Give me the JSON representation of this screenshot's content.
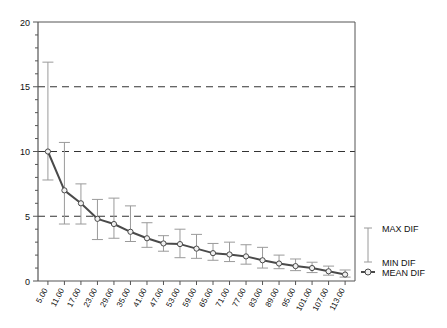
{
  "chart_data": {
    "type": "line",
    "title": "",
    "xlabel": "",
    "ylabel": "",
    "ylim": [
      0,
      20
    ],
    "yticks": [
      0,
      5,
      10,
      15,
      20
    ],
    "ytick_labels": [
      "0",
      "5",
      "10",
      "15",
      "20"
    ],
    "y_minor_tick_step": 1,
    "grid": "horizontal dashed at 5, 10, 15",
    "legend_position": "right",
    "categories": [
      "5.00",
      "11.00",
      "17.00",
      "23.00",
      "29.00",
      "35.00",
      "41.00",
      "47.00",
      "53.00",
      "59.00",
      "65.00",
      "71.00",
      "77.00",
      "83.00",
      "89.00",
      "95.00",
      "101.00",
      "107.00",
      "113.00"
    ],
    "series": [
      {
        "name": "MEAN DIF",
        "values": [
          10.0,
          7.0,
          6.0,
          4.8,
          4.4,
          3.8,
          3.3,
          2.9,
          2.85,
          2.5,
          2.15,
          2.05,
          1.9,
          1.6,
          1.35,
          1.15,
          1.0,
          0.75,
          0.5
        ]
      },
      {
        "name": "MAX DIF",
        "values": [
          16.9,
          10.7,
          7.5,
          6.3,
          6.4,
          5.8,
          4.5,
          3.5,
          4.0,
          3.6,
          2.9,
          3.0,
          2.8,
          2.6,
          2.0,
          1.7,
          1.45,
          1.15,
          0.85
        ]
      },
      {
        "name": "MIN DIF",
        "values": [
          7.8,
          4.4,
          4.4,
          3.2,
          3.3,
          3.05,
          2.6,
          2.3,
          1.8,
          1.75,
          1.6,
          1.5,
          1.3,
          1.0,
          0.95,
          0.8,
          0.65,
          0.45,
          0.3
        ]
      }
    ]
  },
  "legend": {
    "items": [
      {
        "label": "MAX DIF",
        "marker": "errorbar-top-cap"
      },
      {
        "label": "MIN DIF",
        "marker": "errorbar-bottom-cap"
      },
      {
        "label": "MEAN DIF",
        "marker": "circle-line"
      }
    ]
  },
  "colors": {
    "axis": "#555555",
    "grid": "#333333",
    "mean_line": "#4a4a4a",
    "error_bar": "#9a9a9a",
    "marker_fill": "#f0f0f0",
    "text": "#111111"
  }
}
